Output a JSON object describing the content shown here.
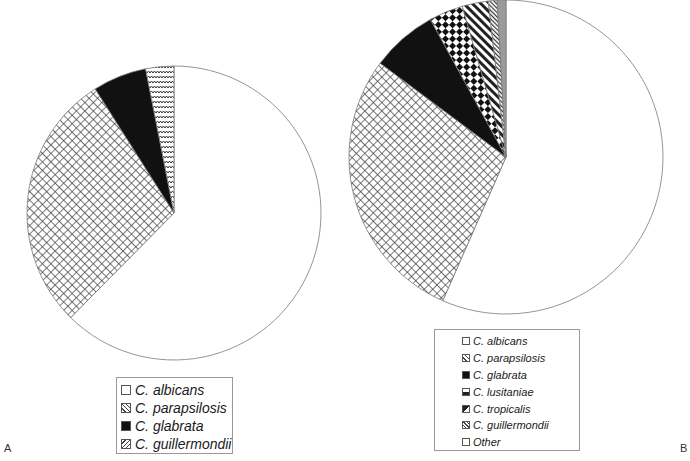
{
  "chart_data": [
    {
      "type": "pie",
      "panel": "A",
      "title": "",
      "categories": [
        "C. albicans",
        "C. parapsilosis",
        "C. glabrata",
        "C. guillermondii"
      ],
      "values": [
        62.4,
        28.6,
        5.9,
        3.1
      ],
      "unit": "%",
      "start_angle_deg": 0,
      "direction": "clockwise",
      "legend_position": "bottom"
    },
    {
      "type": "pie",
      "panel": "B",
      "title": "",
      "categories": [
        "C. albicans",
        "C. parapsilosis",
        "C. glabrata",
        "C. lusitaniae",
        "C. tropicalis",
        "C. guillermondii",
        "Other"
      ],
      "values": [
        56.6,
        28.6,
        6.8,
        3.5,
        2.7,
        0.9,
        0.9
      ],
      "unit": "%",
      "start_angle_deg": 0,
      "direction": "clockwise",
      "legend_position": "bottom"
    }
  ],
  "pies": [
    {
      "cx": 174,
      "cy": 213,
      "r": 147,
      "fills": [
        "url(#p-white)",
        "url(#p-cross)",
        "url(#p-black)",
        "url(#p-zigzag)"
      ]
    },
    {
      "cx": 506,
      "cy": 157,
      "r": 157,
      "fills": [
        "url(#p-white)",
        "url(#p-cross)",
        "url(#p-black)",
        "url(#p-dots)",
        "url(#p-stripes)",
        "url(#p-thin)",
        "url(#p-grey)"
      ]
    }
  ],
  "legend_a": {
    "items": [
      {
        "label": "C. albicans",
        "swatch": "white"
      },
      {
        "label": "C. parapsilosis",
        "swatch": "cross"
      },
      {
        "label": "C. glabrata",
        "swatch": "black"
      },
      {
        "label": "C. guillermondii",
        "swatch": "zigzag"
      }
    ]
  },
  "legend_b": {
    "items": [
      {
        "label": "C. albicans",
        "swatch": "white"
      },
      {
        "label": "C. parapsilosis",
        "swatch": "cross"
      },
      {
        "label": "C. glabrata",
        "swatch": "black"
      },
      {
        "label": "C. lusitaniae",
        "swatch": "dots"
      },
      {
        "label": "C. tropicalis",
        "swatch": "stripes"
      },
      {
        "label": "C. guillermondii",
        "swatch": "thin"
      },
      {
        "label": "Other",
        "swatch": "white"
      }
    ]
  },
  "panel_labels": {
    "a": "A",
    "b": "B"
  },
  "colors": {
    "outline": "#7a7a7a",
    "black": "#111111",
    "grey": "#9a9a9a",
    "hatch": "#444444"
  }
}
